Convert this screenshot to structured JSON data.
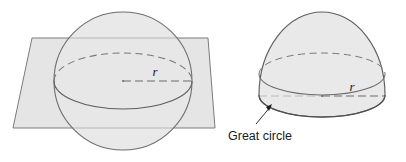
{
  "figure": {
    "background_color": "#ffffff",
    "annotations": {
      "great_circle_label": "Great circle",
      "radius_label_left": "r",
      "radius_label_right": "r"
    },
    "colors": {
      "solid_fill": "#e7e7e7",
      "plane_fill": "#e3e3e3",
      "outline": "#6e6e6e",
      "dashed_stroke": "#777777",
      "text": "#1a1a1a",
      "arrow": "#1a1a1a"
    },
    "left_diagram": {
      "name": "sphere-with-intersecting-plane",
      "sphere": {
        "center_x": 123,
        "center_y": 81,
        "radius": 69
      },
      "plane": {
        "shape": "parallelogram",
        "points": "32,38 208,38 215,128 13,128"
      },
      "great_circle_ellipse": {
        "center_x": 123,
        "center_y": 81,
        "rx": 69,
        "ry": 28
      },
      "radius_line": {
        "from_x": 123,
        "from_y": 81,
        "to_x": 192,
        "to_y": 81,
        "style": "dashed"
      },
      "radius_label_pos": {
        "x": 155,
        "y": 76
      }
    },
    "right_diagram": {
      "name": "hemisphere-dome",
      "dome": {
        "center_x": 322,
        "base_y": 95,
        "rx": 63,
        "top_y": 12
      },
      "base_ellipse": {
        "center_x": 322,
        "center_y": 95,
        "rx": 63,
        "ry": 22
      },
      "great_circle_ellipse": {
        "center_x": 322,
        "center_y": 73,
        "rx": 63,
        "ry": 22
      },
      "radius_line": {
        "from_x": 322,
        "from_y": 96,
        "to_x": 385,
        "to_y": 96,
        "style": "dashed"
      },
      "radius_label_pos": {
        "x": 352,
        "y": 91
      },
      "callout": {
        "arrow_tip_x": 272,
        "arrow_tip_y": 105,
        "arrow_tail_x": 256,
        "arrow_tail_y": 124,
        "label_pos": {
          "x": 228,
          "y": 138
        }
      }
    }
  }
}
